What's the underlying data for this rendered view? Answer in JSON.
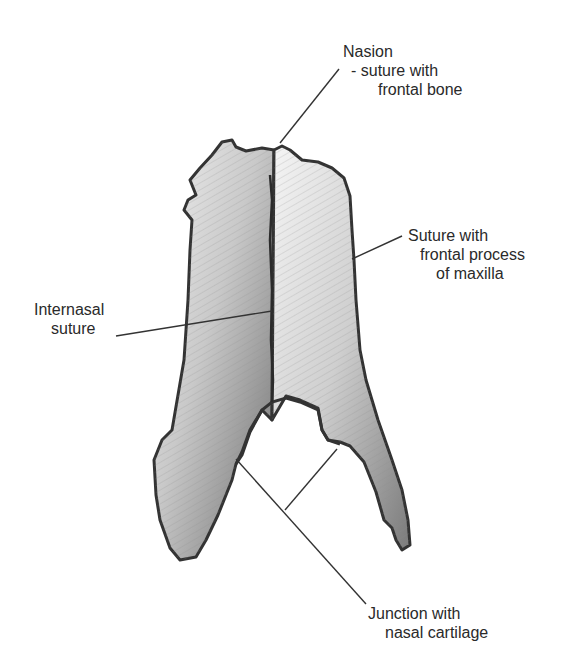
{
  "diagram": {
    "labels": {
      "nasion": {
        "line1": "Nasion",
        "line2": "- suture with",
        "line3": "frontal bone"
      },
      "maxilla": {
        "line1": "Suture with",
        "line2": "frontal process",
        "line3": "of maxilla"
      },
      "internasal": {
        "line1": "Internasal",
        "line2": "suture"
      },
      "cartilage": {
        "line1": "Junction with",
        "line2": "nasal cartilage"
      }
    },
    "colors": {
      "ink": "#2a2a2a",
      "bone_light": "#d8d8d8",
      "bone_dark": "#6a6a6a",
      "outline": "#333333"
    }
  }
}
